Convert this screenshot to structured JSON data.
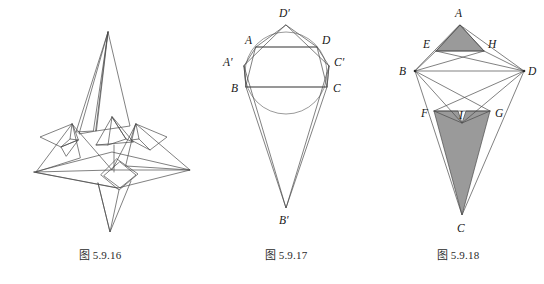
{
  "page": {
    "background_color": "#ffffff",
    "line_color": "#4a4a4a",
    "shade_color": "#9a9a9a",
    "label_color": "#171717"
  },
  "figures": [
    {
      "id": "fig-5-9-16",
      "caption": "图 5.9.16",
      "kind": "origami-crease-diagram",
      "description": "Folded star / airplane-like origami model outline with no point labels",
      "labels": []
    },
    {
      "id": "fig-5-9-17",
      "caption": "图 5.9.17",
      "kind": "geometric-construction",
      "description": "Circle with inscribed quadrilateral ABCD, outer kite A'B'C'D' and long apex B'",
      "labels": [
        {
          "name": "D'",
          "text": "D′"
        },
        {
          "name": "A",
          "text": "A"
        },
        {
          "name": "D",
          "text": "D"
        },
        {
          "name": "A'",
          "text": "A′"
        },
        {
          "name": "C'",
          "text": "C′"
        },
        {
          "name": "B",
          "text": "B"
        },
        {
          "name": "C",
          "text": "C"
        },
        {
          "name": "B'",
          "text": "B′"
        }
      ]
    },
    {
      "id": "fig-5-9-18",
      "caption": "图 5.9.18",
      "kind": "geometric-construction",
      "description": "Kite ABCD with points E,H on AB/AD, F,G on BC/DC, I interior; triangles AEH and FGC shaded gray",
      "labels": [
        {
          "name": "A",
          "text": "A"
        },
        {
          "name": "E",
          "text": "E"
        },
        {
          "name": "H",
          "text": "H"
        },
        {
          "name": "B",
          "text": "B"
        },
        {
          "name": "D",
          "text": "D"
        },
        {
          "name": "F",
          "text": "F"
        },
        {
          "name": "I",
          "text": "I"
        },
        {
          "name": "G",
          "text": "G"
        },
        {
          "name": "C",
          "text": "C"
        }
      ]
    }
  ]
}
